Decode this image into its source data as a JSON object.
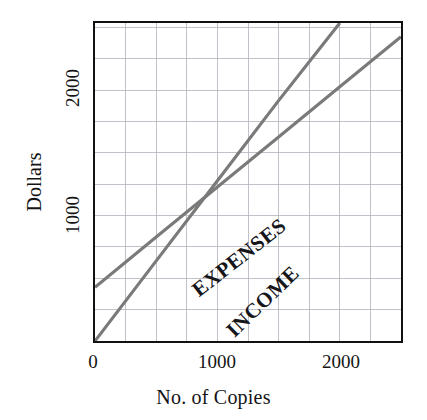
{
  "chart_data": {
    "type": "line",
    "title": "",
    "subtitle": "",
    "xlabel": "No. of Copies",
    "ylabel": "Dollars",
    "xlim": [
      0,
      2500
    ],
    "ylim": [
      0,
      2540
    ],
    "grid": true,
    "grid_x_step": 250,
    "grid_y_step": 250,
    "legend_position": "inline-on-lines",
    "x_ticks": [
      {
        "value": 0,
        "label": "0"
      },
      {
        "value": 1000,
        "label": "1000"
      },
      {
        "value": 2000,
        "label": "2000"
      }
    ],
    "y_ticks": [
      {
        "value": 1000,
        "label": "1000"
      },
      {
        "value": 2000,
        "label": "2000"
      }
    ],
    "series": [
      {
        "name": "EXPENSES",
        "color": "#7a7a7a",
        "x": [
          0,
          500,
          1000,
          1500,
          2000,
          2500
        ],
        "values": [
          430,
          830,
          1230,
          1630,
          2030,
          2430
        ]
      },
      {
        "name": "INCOME",
        "color": "#7a7a7a",
        "x": [
          0,
          500,
          1000,
          1500,
          2000,
          2500
        ],
        "values": [
          0,
          640,
          1280,
          1920,
          2540,
          3180
        ]
      }
    ],
    "annotations": [
      {
        "text": "EXPENSES",
        "series": "EXPENSES"
      },
      {
        "text": "INCOME",
        "series": "INCOME"
      }
    ],
    "notes": {
      "break_even_copies": 960,
      "break_even_dollars": 1230
    }
  },
  "axes": {
    "y_title": "Dollars",
    "x_title": "No. of Copies"
  },
  "colors": {
    "frame": "#111111",
    "grid": "#b9b9c4",
    "line": "#7a7a7a",
    "text": "#141414",
    "background": "#ffffff"
  }
}
